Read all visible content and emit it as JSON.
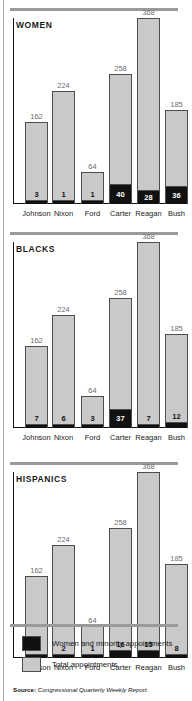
{
  "figure": {
    "source_prefix": "Source:",
    "source_text": "Congressional Quarterly Weekly Report."
  },
  "legend": {
    "items": [
      {
        "swatch": "dark",
        "label": "Women and minority appointments"
      },
      {
        "swatch": "light",
        "label": "Total appointments"
      }
    ]
  },
  "chart_data": [
    {
      "type": "bar",
      "title": "WOMEN",
      "categories": [
        "Johnson",
        "Nixon",
        "Ford",
        "Carter",
        "Reagan",
        "Bush"
      ],
      "series": [
        {
          "name": "Total appointments",
          "values": [
            162,
            224,
            64,
            258,
            368,
            185
          ]
        },
        {
          "name": "Women and minority appointments",
          "values": [
            3,
            1,
            1,
            40,
            28,
            36
          ]
        }
      ],
      "xlabel": "",
      "ylabel": "",
      "ylim": [
        0,
        368
      ],
      "grid": false,
      "legend_position": "bottom"
    },
    {
      "type": "bar",
      "title": "BLACKS",
      "categories": [
        "Johnson",
        "Nixon",
        "Ford",
        "Carter",
        "Reagan",
        "Bush"
      ],
      "series": [
        {
          "name": "Total appointments",
          "values": [
            162,
            224,
            64,
            258,
            368,
            185
          ]
        },
        {
          "name": "Women and minority appointments",
          "values": [
            7,
            6,
            3,
            37,
            7,
            12
          ]
        }
      ],
      "xlabel": "",
      "ylabel": "",
      "ylim": [
        0,
        368
      ],
      "grid": false,
      "legend_position": "bottom"
    },
    {
      "type": "bar",
      "title": "HISPANICS",
      "categories": [
        "Johnson",
        "Nixon",
        "Ford",
        "Carter",
        "Reagan",
        "Bush"
      ],
      "series": [
        {
          "name": "Total appointments",
          "values": [
            162,
            224,
            64,
            258,
            368,
            185
          ]
        },
        {
          "name": "Women and minority appointments",
          "values": [
            3,
            2,
            1,
            16,
            15,
            8
          ]
        }
      ],
      "xlabel": "",
      "ylabel": "",
      "ylim": [
        0,
        368
      ],
      "grid": false,
      "legend_position": "bottom"
    }
  ]
}
